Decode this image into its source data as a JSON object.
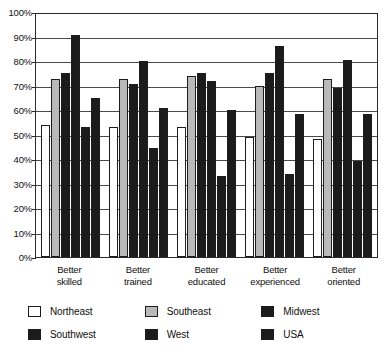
{
  "chart_data": {
    "type": "bar",
    "title": "",
    "xlabel": "",
    "ylabel": "",
    "ylim": [
      0,
      100
    ],
    "grid": true,
    "legend_position": "bottom",
    "categories": [
      "Better skilled",
      "Better trained",
      "Better educated",
      "Better experienced",
      "Better oriented"
    ],
    "category_lines": [
      [
        "Better",
        "skilled"
      ],
      [
        "Better",
        "trained"
      ],
      [
        "Better",
        "educated"
      ],
      [
        "Better",
        "experienced"
      ],
      [
        "Better",
        "oriented"
      ]
    ],
    "y_ticks": [
      "0%",
      "10%",
      "20%",
      "30%",
      "40%",
      "50%",
      "60%",
      "70%",
      "80%",
      "90%",
      "100%"
    ],
    "y_tick_values": [
      0,
      10,
      20,
      30,
      40,
      50,
      60,
      70,
      80,
      90,
      100
    ],
    "series": [
      {
        "name": "Northeast",
        "color": "#ffffff",
        "values": [
          54,
          53,
          53,
          49,
          48
        ]
      },
      {
        "name": "Southeast",
        "color": "#b9b9b9",
        "values": [
          72.5,
          72.5,
          74,
          70,
          72.5
        ]
      },
      {
        "name": "Midwest",
        "color": "#1b1b1b",
        "values": [
          75,
          70.5,
          75,
          75,
          69
        ]
      },
      {
        "name": "Southwest",
        "color": "#1b1b1b",
        "values": [
          90.5,
          80,
          72,
          86,
          80.5
        ]
      },
      {
        "name": "West",
        "color": "#1b1b1b",
        "values": [
          53,
          44.5,
          33,
          34,
          39
        ]
      },
      {
        "name": "USA",
        "color": "#1b1b1b",
        "values": [
          65,
          61,
          60,
          58.5,
          58.5
        ]
      }
    ]
  },
  "legend": {
    "rows": [
      [
        {
          "label": "Northeast",
          "swatch": "white"
        },
        {
          "label": "Southeast",
          "swatch": "gray"
        },
        {
          "label": "Midwest",
          "swatch": "black"
        }
      ],
      [
        {
          "label": "Southwest",
          "swatch": "black"
        },
        {
          "label": "West",
          "swatch": "black"
        },
        {
          "label": "USA",
          "swatch": "black"
        }
      ]
    ]
  }
}
